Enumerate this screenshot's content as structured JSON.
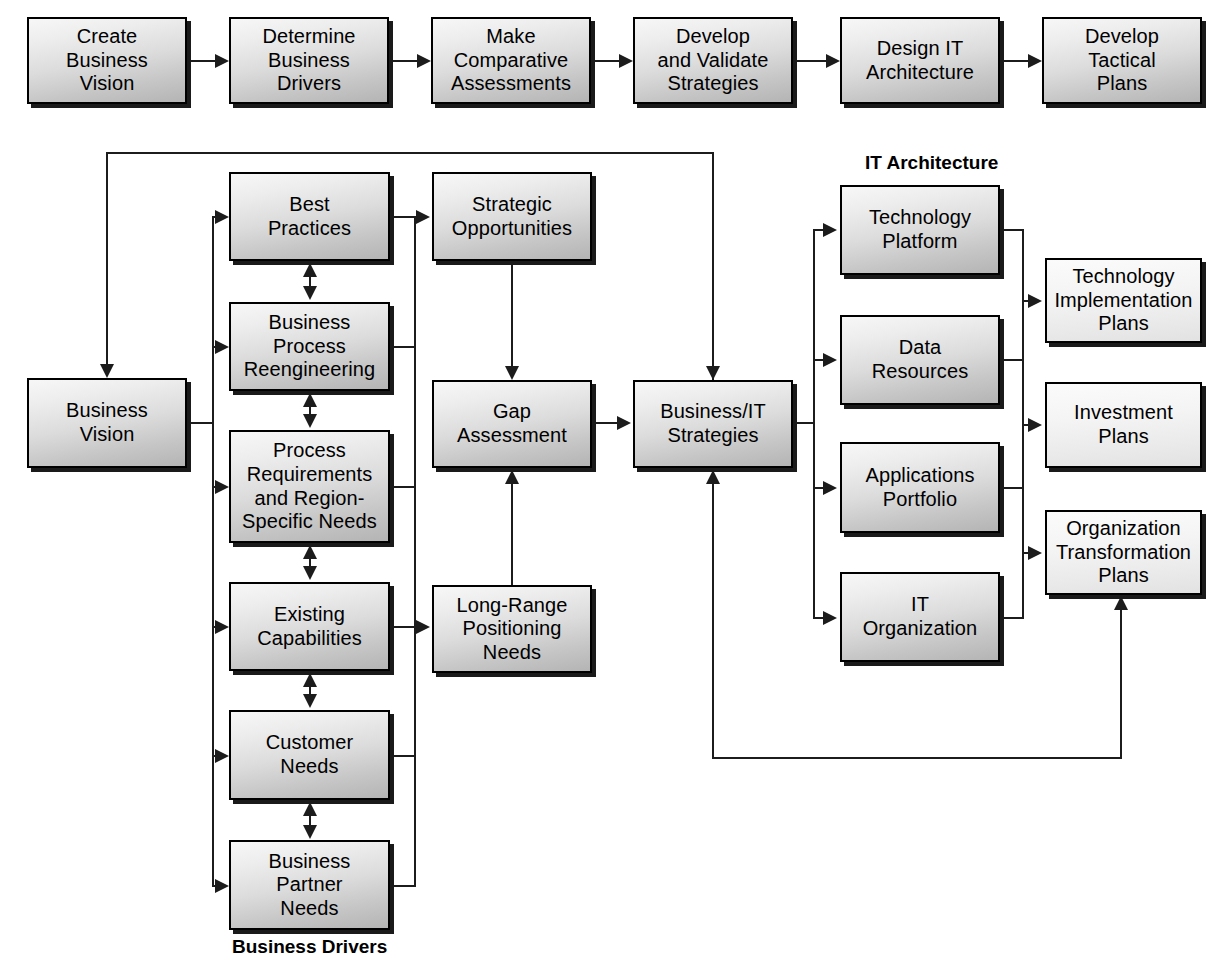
{
  "diagram": {
    "type": "flowchart",
    "colors": {
      "box_fill_dark": "#c6c6c6",
      "box_fill_light": "#eaeaea",
      "border": "#000000",
      "shadow": "#1a1a1a",
      "connector": "#1c1c1c"
    }
  },
  "top_row": {
    "steps": [
      {
        "id": "create-business-vision",
        "label": "Create\nBusiness\nVision"
      },
      {
        "id": "determine-business-drivers",
        "label": "Determine\nBusiness\nDrivers"
      },
      {
        "id": "make-comparative-assessments",
        "label": "Make\nComparative\nAssessments"
      },
      {
        "id": "develop-and-validate-strategies",
        "label": "Develop\nand Validate\nStrategies"
      },
      {
        "id": "design-it-architecture",
        "label": "Design IT\nArchitecture"
      },
      {
        "id": "develop-tactical-plans",
        "label": "Develop\nTactical\nPlans"
      }
    ]
  },
  "vision": {
    "box": {
      "id": "business-vision",
      "label": "Business\nVision"
    }
  },
  "business_drivers": {
    "caption": "Business Drivers",
    "boxes": [
      {
        "id": "best-practices",
        "label": "Best\nPractices"
      },
      {
        "id": "business-process-reengineering",
        "label": "Business\nProcess\nReengineering"
      },
      {
        "id": "process-requirements-and-region-specific-needs",
        "label": "Process\nRequirements\nand Region-\nSpecific Needs"
      },
      {
        "id": "existing-capabilities",
        "label": "Existing\nCapabilities"
      },
      {
        "id": "customer-needs",
        "label": "Customer\nNeeds"
      },
      {
        "id": "business-partner-needs",
        "label": "Business\nPartner\nNeeds"
      }
    ]
  },
  "assessment": {
    "boxes": [
      {
        "id": "strategic-opportunities",
        "label": "Strategic\nOpportunities"
      },
      {
        "id": "gap-assessment",
        "label": "Gap\nAssessment"
      },
      {
        "id": "long-range-positioning-needs",
        "label": "Long-Range\nPositioning\nNeeds"
      }
    ]
  },
  "strategies": {
    "box": {
      "id": "business-it-strategies",
      "label": "Business/IT\nStrategies"
    }
  },
  "it_architecture": {
    "caption": "IT Architecture",
    "boxes": [
      {
        "id": "technology-platform",
        "label": "Technology\nPlatform"
      },
      {
        "id": "data-resources",
        "label": "Data\nResources"
      },
      {
        "id": "applications-portfolio",
        "label": "Applications\nPortfolio"
      },
      {
        "id": "it-organization",
        "label": "IT\nOrganization"
      }
    ]
  },
  "plans": {
    "boxes": [
      {
        "id": "technology-implementation-plans",
        "label": "Technology\nImplementation\nPlans"
      },
      {
        "id": "investment-plans",
        "label": "Investment\nPlans"
      },
      {
        "id": "organization-transformation-plans",
        "label": "Organization\nTransformation\nPlans"
      }
    ]
  }
}
